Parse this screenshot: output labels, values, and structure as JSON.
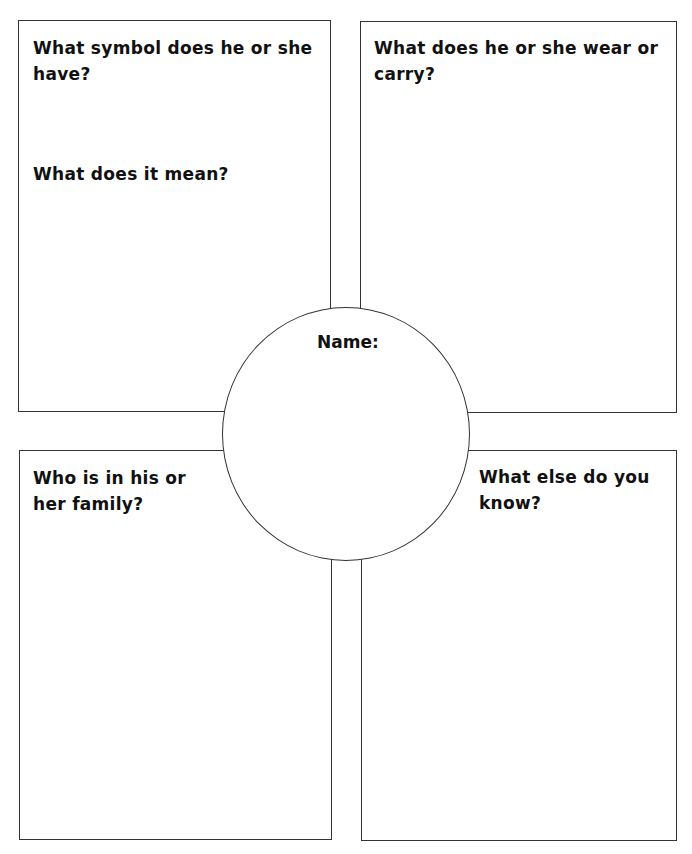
{
  "worksheet": {
    "boxes": {
      "top_left": {
        "questions": [
          "What symbol does he or she have?",
          "What does it mean?"
        ]
      },
      "top_right": {
        "questions": [
          "What does he or she wear or carry?"
        ]
      },
      "bottom_left": {
        "questions": [
          "Who is in his or her family?"
        ]
      },
      "bottom_right": {
        "questions": [
          "What else do you know?"
        ]
      }
    },
    "center": {
      "label": "Name:"
    },
    "colors": {
      "border": "#333333",
      "text": "#111111",
      "background": "#ffffff"
    }
  }
}
